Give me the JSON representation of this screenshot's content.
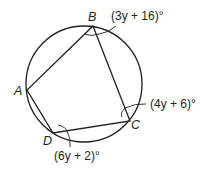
{
  "diagram": {
    "type": "inscribed quadrilateral in circle",
    "points": {
      "A": "A",
      "B": "B",
      "C": "C",
      "D": "D"
    },
    "angles": {
      "B": "(3y + 16)°",
      "C": "(4y + 6)°",
      "D": "(6y + 2)°"
    },
    "colors": {
      "stroke": "#231f20",
      "background": "#ffffff"
    }
  }
}
